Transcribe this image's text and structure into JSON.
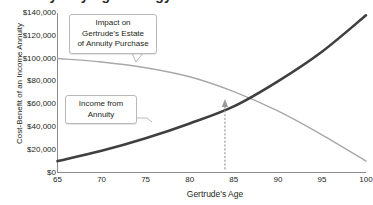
{
  "clipped_heading": "Annuity Buying Strategy",
  "chart_data": {
    "type": "line",
    "title": "",
    "xlabel": "Gertrude's Age",
    "ylabel": "Cost-Benefit of an Income Annuity",
    "xlim": [
      65,
      100
    ],
    "ylim": [
      0,
      140000
    ],
    "xticks": [
      "65",
      "70",
      "75",
      "80",
      "85",
      "90",
      "95",
      "100"
    ],
    "xtick_values": [
      65,
      70,
      75,
      80,
      85,
      90,
      95,
      100
    ],
    "yticks": [
      "$0",
      "$20,000",
      "$40,000",
      "$60,000",
      "$80,000",
      "$100,000",
      "$120,000",
      "$140,000"
    ],
    "ytick_values": [
      0,
      20000,
      40000,
      60000,
      80000,
      100000,
      120000,
      140000
    ],
    "grid": false,
    "legend": "none",
    "x": [
      65,
      70,
      75,
      80,
      85,
      90,
      95,
      100
    ],
    "series": [
      {
        "name": "Impact on Gertrude's Estate of Annuity Purchase",
        "color": "#a8a8a8",
        "width": 1.4,
        "values": [
          100000,
          97000,
          92000,
          84000,
          71000,
          54000,
          33000,
          10000
        ]
      },
      {
        "name": "Income from Annuity",
        "color": "#3f3f3f",
        "width": 2.6,
        "values": [
          10000,
          19000,
          30000,
          43000,
          58000,
          80000,
          106000,
          138000
        ]
      }
    ],
    "annotations": [
      {
        "name": "crossover",
        "x": 84,
        "y": 69000,
        "marker": "up-arrow",
        "leader": "dotted-vertical",
        "label": ""
      }
    ]
  },
  "callouts": {
    "estate": {
      "lines": [
        "Impact on",
        "Gertrude's Estate",
        "of Annuity Purchase"
      ]
    },
    "income": {
      "lines": [
        "Income from",
        "Annuity"
      ]
    }
  },
  "colors": {
    "income_line": "#3f3f3f",
    "estate_line": "#a8a8a8",
    "axis": "#8c8c8c",
    "text": "#231f20",
    "callout_border": "#b9b9b9",
    "crossover_marker": "#9a9a9a"
  }
}
